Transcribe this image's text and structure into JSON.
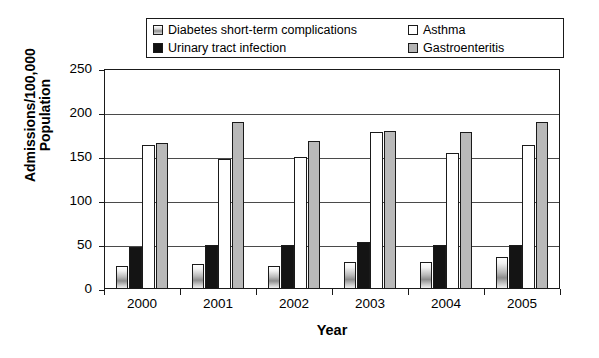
{
  "chart_data": {
    "type": "bar",
    "title": "",
    "xlabel": "Year",
    "ylabel_line1": "Admissions/100,000",
    "ylabel_line2": "Population",
    "categories": [
      "2000",
      "2001",
      "2002",
      "2003",
      "2004",
      "2005"
    ],
    "ylim": [
      0,
      250
    ],
    "yticks": [
      0,
      50,
      100,
      150,
      200,
      250
    ],
    "ytick_labels": [
      "0",
      "50",
      "100",
      "150",
      "200",
      "250"
    ],
    "grid": true,
    "legend_position": "top",
    "series": [
      {
        "name": "Diabetes short-term complications",
        "swatch": "sw-diabetes",
        "bar_class": "b-diabetes",
        "values": [
          26,
          28,
          26,
          31,
          31,
          36
        ]
      },
      {
        "name": "Urinary tract infection",
        "swatch": "sw-uti",
        "bar_class": "b-uti",
        "values": [
          48,
          50,
          50,
          53,
          50,
          50
        ]
      },
      {
        "name": "Asthma",
        "swatch": "sw-asthma",
        "bar_class": "b-asthma",
        "values": [
          164,
          148,
          150,
          178,
          155,
          164
        ]
      },
      {
        "name": "Gastroenteritis",
        "swatch": "sw-gastro",
        "bar_class": "b-gastro",
        "values": [
          166,
          190,
          168,
          180,
          178,
          190
        ]
      }
    ]
  },
  "legend": {
    "items": [
      {
        "label": "Diabetes short-term complications",
        "swatch": "sw-diabetes",
        "cell": "tl"
      },
      {
        "label": "Asthma",
        "swatch": "sw-asthma",
        "cell": "tr"
      },
      {
        "label": "Urinary tract infection",
        "swatch": "sw-uti",
        "cell": "bl"
      },
      {
        "label": "Gastroenteritis",
        "swatch": "sw-gastro",
        "cell": "br"
      }
    ]
  },
  "colors": {
    "axis": "#1a1a1a",
    "grid": "#4a4a4a",
    "diabetes": "#b9b9b9",
    "uti": "#141414",
    "asthma": "#ffffff",
    "gastroenteritis": "#b9b9b9",
    "background": "#ffffff"
  }
}
